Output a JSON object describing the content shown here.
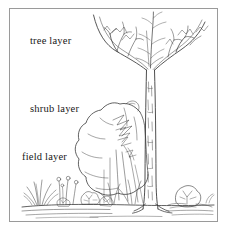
{
  "figure": {
    "style": "pen-and-ink line drawing",
    "background_color": "#ffffff",
    "ink_color": "#333333",
    "frame_color": "#9a9a9a"
  },
  "labels": {
    "tree": "tree layer",
    "shrub": "shrub layer",
    "field": "field layer"
  },
  "elements": {
    "tree": "bare-deciduous-tree",
    "shrub": "large-rounded-shrub",
    "field": "grass-tufts-flowers-and-rocks",
    "ground": "ground-line"
  }
}
